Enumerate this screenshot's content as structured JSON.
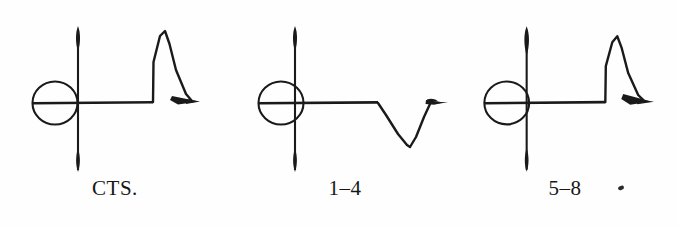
{
  "image": {
    "kind": "scanned-figure-plate",
    "width": 679,
    "height": 227,
    "background_color": "#fefefe",
    "ink_color": "#1a1a1a"
  },
  "figures": [
    {
      "id": "cts",
      "caption": "CTS.",
      "deflection": "upward-spike",
      "description": "cross axis with open circle at left, flat baseline, tall narrow upward spike with filled triangular descending tail",
      "circle": {
        "cx": 55,
        "cy": 103,
        "r": 22
      },
      "vertical_axis": {
        "x": 78,
        "y_top": 26,
        "y_bottom": 172
      },
      "baseline": {
        "y": 103,
        "x_start": 78,
        "x_end": 153
      },
      "spike": {
        "x_rise": 153,
        "x_peak": 166,
        "y_peak": 33,
        "x_end": 199
      },
      "tail_filled": true
    },
    {
      "id": "leads-1-4",
      "caption": "1–4",
      "deflection": "downward-dip",
      "description": "cross axis with open circle at left, flat baseline, downward V-shaped dip returning to a filled arrowhead blob at baseline level",
      "circle": {
        "cx": 281,
        "cy": 103,
        "r": 22
      },
      "vertical_axis": {
        "x": 295,
        "y_top": 26,
        "y_bottom": 172
      },
      "baseline": {
        "y": 103,
        "x_start": 295,
        "x_end": 378
      },
      "dip": {
        "x_start": 378,
        "x_trough": 408,
        "y_trough": 147,
        "x_end": 432
      },
      "tail_filled": true
    },
    {
      "id": "leads-5-8",
      "caption": "5–8",
      "deflection": "upward-spike",
      "description": "cross axis with open circle at left, long flat baseline, tall narrow upward spike with filled triangular descending tail",
      "circle": {
        "cx": 507,
        "cy": 103,
        "r": 22
      },
      "vertical_axis": {
        "x": 527,
        "y_top": 26,
        "y_bottom": 172
      },
      "baseline": {
        "y": 103,
        "x_start": 527,
        "x_end": 606
      },
      "spike": {
        "x_rise": 606,
        "x_peak": 619,
        "y_peak": 37,
        "x_end": 648
      },
      "tail_filled": true
    }
  ],
  "marks": {
    "stray_speck": {
      "present": true,
      "near": "5–8",
      "x": 618,
      "y": 186
    }
  }
}
